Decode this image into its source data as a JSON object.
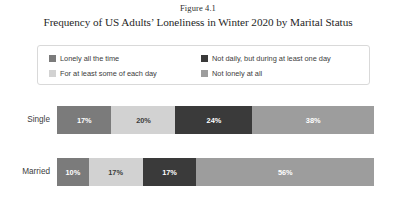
{
  "figure": {
    "number": "Figure 4.1",
    "title": "Frequency of US Adults’ Loneliness in Winter 2020 by Marital Status"
  },
  "legend": {
    "items": [
      {
        "label": "Lonely all the time",
        "color": "#7b7b7b"
      },
      {
        "label": "Not daily, but during at least one day",
        "color": "#3a3a3a"
      },
      {
        "label": "For at least some of each day",
        "color": "#d2d2d2"
      },
      {
        "label": "Not lonely at all",
        "color": "#9d9d9d"
      }
    ]
  },
  "chart_data": {
    "type": "bar",
    "orientation": "horizontal",
    "stacked": true,
    "stack_total": 100,
    "title": "Frequency of US Adults’ Loneliness in Winter 2020 by Marital Status",
    "xlabel": "",
    "ylabel": "",
    "xlim": [
      0,
      100
    ],
    "grid": false,
    "legend_position": "top",
    "categories": [
      "Single",
      "Married"
    ],
    "series": [
      {
        "name": "Lonely all the time",
        "color": "#7b7b7b",
        "text_color": "#ffffff",
        "values": [
          17,
          10
        ],
        "labels": [
          "17%",
          "10%"
        ]
      },
      {
        "name": "For at least some of each day",
        "color": "#d2d2d2",
        "text_color": "#3c3c3c",
        "values": [
          20,
          17
        ],
        "labels": [
          "20%",
          "17%"
        ]
      },
      {
        "name": "Not daily, but during at least one day",
        "color": "#3a3a3a",
        "text_color": "#ffffff",
        "values": [
          24,
          17
        ],
        "labels": [
          "24%",
          "17%"
        ]
      },
      {
        "name": "Not lonely at all",
        "color": "#9d9d9d",
        "text_color": "#ffffff",
        "values": [
          38,
          56
        ],
        "labels": [
          "38%",
          "56%"
        ]
      }
    ]
  }
}
